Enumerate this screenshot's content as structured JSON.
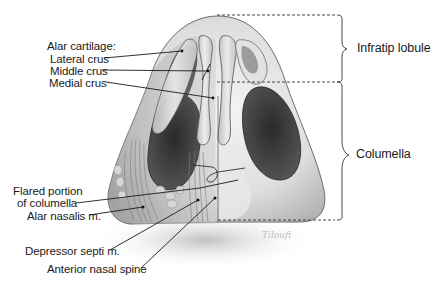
{
  "figure": {
    "labels_left": [
      {
        "id": "alar-cartilage",
        "text": "Alar cartilage:",
        "x": 47,
        "y": 41
      },
      {
        "id": "lateral-crus",
        "text": "Lateral crus",
        "x": 50,
        "y": 54
      },
      {
        "id": "middle-crus",
        "text": "Middle crus",
        "x": 50,
        "y": 66
      },
      {
        "id": "medial-crus",
        "text": "Medial crus",
        "x": 49,
        "y": 78
      },
      {
        "id": "flared-portion-1",
        "text": "Flared portion",
        "x": 13,
        "y": 186
      },
      {
        "id": "flared-portion-2",
        "text": "of columella",
        "x": 17,
        "y": 198
      },
      {
        "id": "alar-nasalis",
        "text": "Alar nasalis m.",
        "x": 27,
        "y": 211
      },
      {
        "id": "depressor-septi",
        "text": "Depressor septi m.",
        "x": 25,
        "y": 246
      },
      {
        "id": "anterior-nasal-spine",
        "text": "Anterior nasal spine",
        "x": 47,
        "y": 264
      }
    ],
    "labels_right": [
      {
        "id": "infratip-lobule",
        "text": "Infratip lobule",
        "x": 357,
        "y": 42
      },
      {
        "id": "columella",
        "text": "Columella",
        "x": 356,
        "y": 148
      }
    ],
    "regions": [
      {
        "name": "Infratip lobule",
        "y_top": 15,
        "y_bottom": 82
      },
      {
        "name": "Columella",
        "y_top": 82,
        "y_bottom": 220
      }
    ],
    "signature": "Tiloufi",
    "colors": {
      "ink": "#1a1a1a",
      "skin_light": "#ececec",
      "skin_mid": "#c9c9c9",
      "skin_dark": "#8d8d8d",
      "nostril": "#3a3a3a",
      "cartilage": "#dcdcdc",
      "dash": "#333333"
    }
  }
}
